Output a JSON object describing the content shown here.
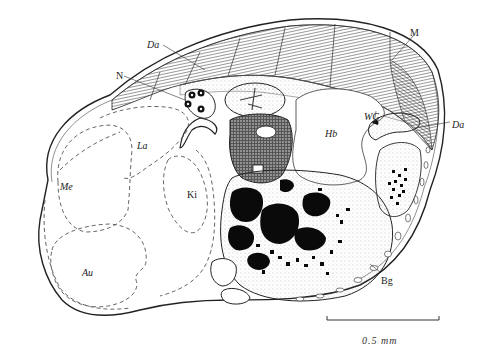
{
  "figure": {
    "type": "anatomical cross-section illustration",
    "labels": [
      {
        "id": "Da_top",
        "text": "Da",
        "x": 147,
        "y": 40
      },
      {
        "id": "N",
        "text": "N",
        "x": 116,
        "y": 71
      },
      {
        "id": "M",
        "text": "M",
        "x": 410,
        "y": 28
      },
      {
        "id": "WG",
        "text": "WG",
        "x": 364,
        "y": 112
      },
      {
        "id": "Da_right",
        "text": "Da",
        "x": 452,
        "y": 120
      },
      {
        "id": "La",
        "text": "La",
        "x": 137,
        "y": 141
      },
      {
        "id": "Me",
        "text": "Me",
        "x": 60,
        "y": 182
      },
      {
        "id": "Ki",
        "text": "Ki",
        "x": 187,
        "y": 190
      },
      {
        "id": "Hb",
        "text": "Hb",
        "x": 325,
        "y": 129
      },
      {
        "id": "Au",
        "text": "Au",
        "x": 82,
        "y": 268
      },
      {
        "id": "Bg",
        "text": "Bg",
        "x": 381,
        "y": 276
      }
    ],
    "scale_bar": {
      "text": "0.5 mm",
      "x1": 327,
      "x2": 439,
      "y": 320
    }
  },
  "colors": {
    "ink": "#1a1a1a",
    "paper": "#ffffff",
    "stipple": "#bdbdbd"
  }
}
